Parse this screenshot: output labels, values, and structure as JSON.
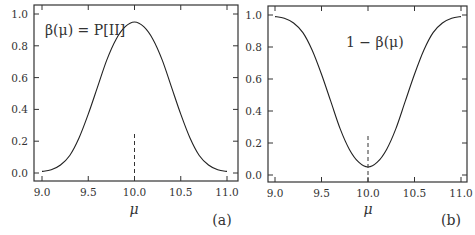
{
  "chart_data": [
    {
      "type": "line",
      "panel_label": "(a)",
      "title": "",
      "annotation": "β(μ) = P[II]",
      "annotation_parts": {
        "lhs": "β(μ)",
        "eq": " = ",
        "rhs": "P[II]"
      },
      "xlabel": "μ",
      "ylabel": "",
      "xlim": [
        8.92,
        11.1
      ],
      "ylim": [
        -0.05,
        1.05
      ],
      "xticks": [
        9.0,
        9.5,
        10.0,
        10.5,
        11.0
      ],
      "xtick_labels": [
        "9.0",
        "9.5",
        "10.0",
        "10.5",
        "11.0"
      ],
      "yticks": [
        0.0,
        0.2,
        0.4,
        0.6,
        0.8,
        1.0
      ],
      "ytick_labels": [
        "0.0",
        "0.2",
        "0.4",
        "0.6",
        "0.8",
        "1.0"
      ],
      "grid": false,
      "series": [
        {
          "name": "β(μ)",
          "x": [
            9.0,
            9.1,
            9.2,
            9.3,
            9.4,
            9.5,
            9.6,
            9.7,
            9.8,
            9.9,
            10.0,
            10.1,
            10.2,
            10.3,
            10.4,
            10.5,
            10.6,
            10.7,
            10.8,
            10.9,
            11.0
          ],
          "values": [
            0.01,
            0.02,
            0.05,
            0.11,
            0.22,
            0.37,
            0.54,
            0.71,
            0.84,
            0.92,
            0.95,
            0.92,
            0.84,
            0.71,
            0.54,
            0.37,
            0.22,
            0.11,
            0.05,
            0.02,
            0.01
          ]
        }
      ],
      "reference_line": {
        "style": "dashed",
        "x": 10.0,
        "y_from": 0.0,
        "y_to": 0.26
      }
    },
    {
      "type": "line",
      "panel_label": "(b)",
      "title": "",
      "annotation": "1 − β(μ)",
      "xlabel": "μ",
      "ylabel": "",
      "xlim": [
        8.92,
        11.08
      ],
      "ylim": [
        -0.05,
        1.05
      ],
      "xticks": [
        9.0,
        9.5,
        10.0,
        10.5,
        11.0
      ],
      "xtick_labels": [
        "9.0",
        "9.5",
        "10.0",
        "10.5",
        "11.0"
      ],
      "yticks": [
        0.0,
        0.2,
        0.4,
        0.6,
        0.8,
        1.0
      ],
      "ytick_labels": [
        "0.0",
        "0.2",
        "0.4",
        "0.6",
        "0.8",
        "1.0"
      ],
      "grid": false,
      "series": [
        {
          "name": "1 − β(μ)",
          "x": [
            9.0,
            9.1,
            9.2,
            9.3,
            9.4,
            9.5,
            9.6,
            9.7,
            9.8,
            9.9,
            10.0,
            10.1,
            10.2,
            10.3,
            10.4,
            10.5,
            10.6,
            10.7,
            10.8,
            10.9,
            11.0
          ],
          "values": [
            0.99,
            0.98,
            0.95,
            0.89,
            0.78,
            0.63,
            0.46,
            0.29,
            0.16,
            0.08,
            0.05,
            0.08,
            0.16,
            0.29,
            0.46,
            0.63,
            0.78,
            0.89,
            0.95,
            0.98,
            0.99
          ]
        }
      ],
      "reference_line": {
        "style": "dashed",
        "x": 10.0,
        "y_from": -0.05,
        "y_to": 0.26
      }
    }
  ]
}
